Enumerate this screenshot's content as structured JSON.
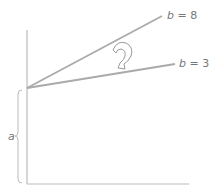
{
  "diagram": {
    "type": "linear-function-slope-comparison",
    "intercept_label": "a",
    "lines": [
      {
        "name": "steep",
        "label_var": "b",
        "label_eq": " = 8",
        "slope": 8
      },
      {
        "name": "shallow",
        "label_var": "b",
        "label_eq": " = 3",
        "slope": 3
      }
    ],
    "rotation_arrow": "curved-arrow-icon",
    "colors": {
      "line": "#aaaaaa",
      "axis": "#bbbbbb",
      "text": "#777777"
    }
  }
}
